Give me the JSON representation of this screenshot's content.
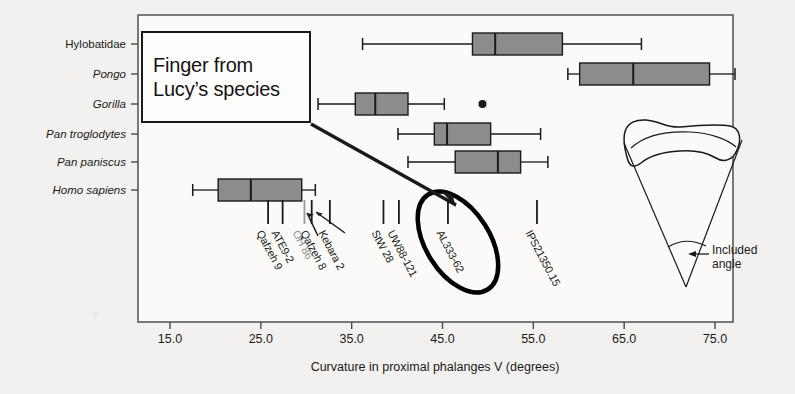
{
  "figure": {
    "axis_title": "Curvature in proximal phalanges V (degrees)",
    "xticks": [
      "15.0",
      "25.0",
      "35.0",
      "45.0",
      "55.0",
      "65.0",
      "75.0"
    ],
    "xtick_values": [
      15,
      25,
      35,
      45,
      55,
      65,
      75
    ],
    "callout": {
      "line1": "Finger from",
      "line2": "Lucy’s species"
    },
    "inset": {
      "label_line1": "Included",
      "label_line2": "angle",
      "name": "proximal-phalanx-included-angle-diagram"
    },
    "colors": {
      "box_fill": "#8c8c8c",
      "line": "#1a1a1a",
      "background": "#f2f1ef",
      "plot_background": "#fbfaf8",
      "highlight_ellipse": "#000000"
    }
  },
  "chart_data": {
    "type": "box",
    "title": "Curvature in proximal phalanges V (degrees)",
    "xlabel": "Curvature in proximal phalanges V (degrees)",
    "ylabel": "",
    "xlim": [
      12.5,
      77.5
    ],
    "xticks": [
      15,
      25,
      35,
      45,
      55,
      65,
      75
    ],
    "grid": false,
    "legend": "none",
    "categories": [
      "Hylobatidae",
      "Pongo",
      "Gorilla",
      "Pan troglodytes",
      "Pan paniscus",
      "Homo sapiens"
    ],
    "boxes": [
      {
        "category": "Hylobatidae",
        "italic": false,
        "whisker_low": 36.2,
        "q1": 48.3,
        "median": 50.8,
        "q3": 58.2,
        "whisker_high": 66.9,
        "outliers": []
      },
      {
        "category": "Pongo",
        "italic": true,
        "whisker_low": 58.8,
        "q1": 60.1,
        "median": 66.0,
        "q3": 74.4,
        "whisker_high": 77.2,
        "outliers": []
      },
      {
        "category": "Gorilla",
        "italic": true,
        "whisker_low": 31.3,
        "q1": 35.4,
        "median": 37.6,
        "q3": 41.2,
        "whisker_high": 45.2,
        "outliers": [
          49.4
        ]
      },
      {
        "category": "Pan troglodytes",
        "italic": true,
        "whisker_low": 40.1,
        "q1": 44.1,
        "median": 45.5,
        "q3": 50.3,
        "whisker_high": 55.8,
        "outliers": []
      },
      {
        "category": "Pan paniscus",
        "italic": true,
        "whisker_low": 41.2,
        "q1": 46.4,
        "median": 51.1,
        "q3": 53.6,
        "whisker_high": 56.6,
        "outliers": []
      },
      {
        "category": "Homo sapiens",
        "italic": true,
        "whisker_low": 17.5,
        "q1": 20.3,
        "median": 23.9,
        "q3": 29.5,
        "whisker_high": 31.0,
        "outliers": []
      }
    ],
    "specimens": [
      {
        "name": "Qafzeh 9",
        "value": 25.8,
        "highlighted": false,
        "faint": false,
        "arrow": false
      },
      {
        "name": "ATE9-2",
        "value": 27.4,
        "highlighted": false,
        "faint": false,
        "arrow": false
      },
      {
        "name": "OH 86",
        "value": 29.8,
        "highlighted": false,
        "faint": true,
        "arrow": true
      },
      {
        "name": "Qafzeh 8",
        "value": 30.6,
        "highlighted": false,
        "faint": false,
        "arrow": false
      },
      {
        "name": "Kebara 2",
        "value": 32.6,
        "highlighted": false,
        "faint": false,
        "arrow": true
      },
      {
        "name": "StW 28",
        "value": 38.5,
        "highlighted": false,
        "faint": false,
        "arrow": false
      },
      {
        "name": "UW88-121",
        "value": 40.2,
        "highlighted": false,
        "faint": false,
        "arrow": false
      },
      {
        "name": "AL333-62",
        "value": 45.6,
        "highlighted": true,
        "faint": false,
        "arrow": false
      },
      {
        "name": "IPS21350.15",
        "value": 55.4,
        "highlighted": false,
        "faint": false,
        "arrow": false
      }
    ]
  }
}
